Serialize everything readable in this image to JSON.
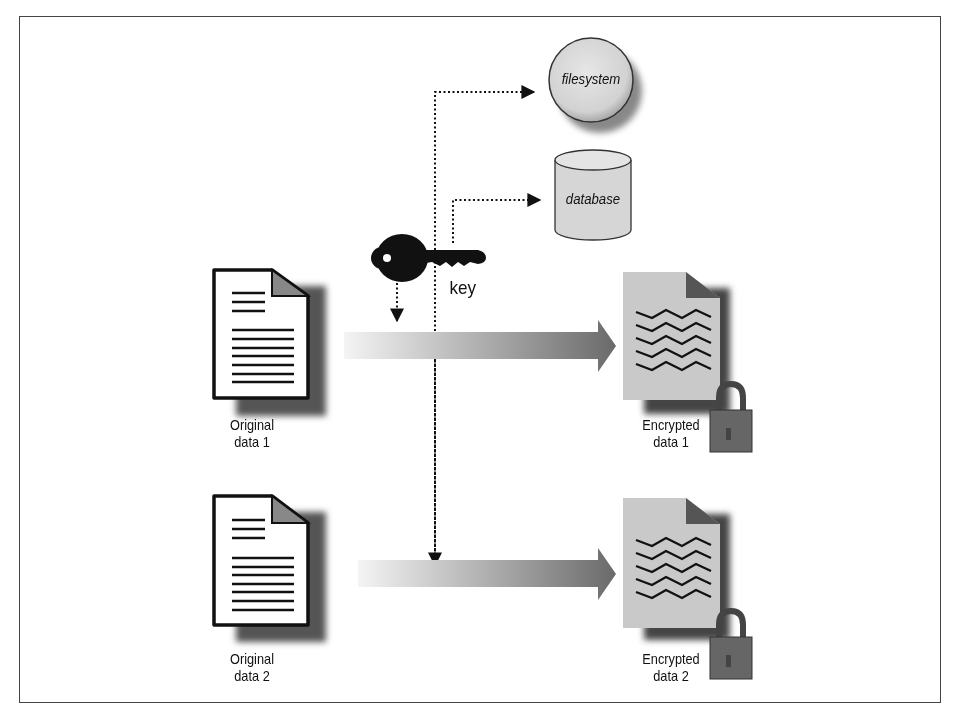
{
  "diagram": {
    "storage": {
      "filesystem_label": "filesystem",
      "database_label": "database"
    },
    "key_label": "key",
    "rows": [
      {
        "source_label_line1": "Original",
        "source_label_line2": "data 1",
        "target_label_line1": "Encrypted",
        "target_label_line2": "data 1"
      },
      {
        "source_label_line1": "Original",
        "source_label_line2": "data 2",
        "target_label_line1": "Encrypted",
        "target_label_line2": "data 2"
      }
    ],
    "colors": {
      "document_fill": "#ffffff",
      "encrypted_fill": "#c8c8c8",
      "arrow_start": "#f2f2f2",
      "arrow_end": "#6e6e6e",
      "storage_fill": "#dcdcdc",
      "ink": "#111111"
    }
  }
}
